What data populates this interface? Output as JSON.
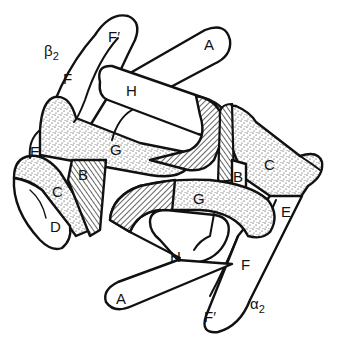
{
  "diagram": {
    "colors": {
      "ink": "#111111",
      "background": "#ffffff"
    },
    "subunits": [
      {
        "id": "beta2",
        "label": "β",
        "subscript": "2"
      },
      {
        "id": "alpha2",
        "label": "α",
        "subscript": "2"
      }
    ],
    "labels": {
      "beta2": {
        "A": "A",
        "B": "B",
        "C": "C",
        "D": "D",
        "E": "E",
        "F": "F",
        "Fprime": "F′",
        "G": "G",
        "H": "H"
      },
      "alpha2": {
        "A": "A",
        "B": "B",
        "C": "C",
        "E": "E",
        "F": "F",
        "Fprime": "F′",
        "G": "G",
        "H": "H"
      }
    },
    "shading": {
      "stipple": "contact surface (stippled)",
      "hatch": "contact surface (hatched)"
    }
  }
}
